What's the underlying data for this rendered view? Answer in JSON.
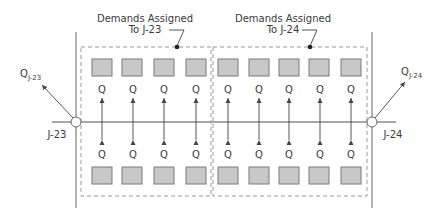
{
  "diagram": {
    "groups": [
      {
        "label_line1": "Demands Assigned",
        "label_line2": "To J-23",
        "junction": "J-23"
      },
      {
        "label_line1": "Demands Assigned",
        "label_line2": "To J-24",
        "junction": "J-24"
      }
    ],
    "junctions": [
      {
        "name": "J-23",
        "flow_label": "Q",
        "flow_subscript": "J-23"
      },
      {
        "name": "J-24",
        "flow_label": "Q",
        "flow_subscript": "J-24"
      }
    ],
    "demand_label": "Q",
    "demand_count_per_row": 9,
    "colors": {
      "line": "#8a8a8a",
      "box_fill": "#c8c8c8",
      "box_stroke": "#7a7a7a",
      "dashed": "#9a9a9a",
      "text": "#3a3a3a",
      "arrow": "#444444"
    }
  }
}
